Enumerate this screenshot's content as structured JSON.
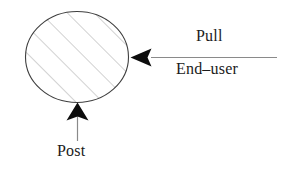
{
  "figure": {
    "type": "diagram",
    "background_color": "#ffffff",
    "width": 294,
    "height": 172,
    "shapes": {
      "ellipse": {
        "name": "hatched-ellipse",
        "center_x": 77,
        "center_y": 57,
        "radius_x": 52,
        "radius_y": 46,
        "outline_color": "#3a3a3a",
        "fill_pattern": "diagonal-hatch",
        "hatch_color": "#c9c9c9",
        "hatch_angle_degrees": 45
      },
      "pull_arrow": {
        "name": "pull-arrow",
        "direction": "left",
        "line_start_x": 277,
        "line_end_x": 150,
        "line_y": 57,
        "tip_x": 131,
        "color": "#111111"
      },
      "post_arrow": {
        "name": "post-arrow",
        "direction": "up",
        "line_x": 77,
        "line_start_y": 140,
        "line_end_y": 115,
        "tip_y": 103,
        "color": "#111111"
      }
    },
    "labels": {
      "pull": "Pull",
      "end_user": "End–user",
      "post": "Post"
    }
  }
}
